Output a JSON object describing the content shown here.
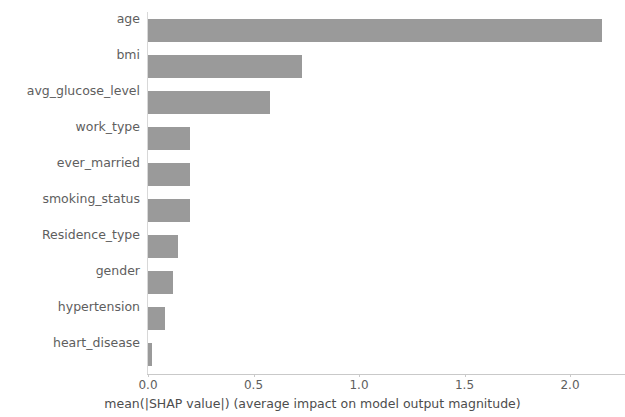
{
  "chart_data": {
    "type": "bar",
    "orientation": "horizontal",
    "title": "",
    "xlabel": "mean(|SHAP value|) (average impact on model output magnitude)",
    "ylabel": "",
    "categories": [
      "age",
      "bmi",
      "avg_glucose_level",
      "work_type",
      "ever_married",
      "smoking_status",
      "Residence_type",
      "gender",
      "hypertension",
      "heart_disease"
    ],
    "values": [
      2.15,
      0.73,
      0.58,
      0.2,
      0.2,
      0.2,
      0.14,
      0.12,
      0.08,
      0.02
    ],
    "xlim": [
      0.0,
      2.26
    ],
    "xticks": [
      0.0,
      0.5,
      1.0,
      1.5,
      2.0
    ],
    "xticklabels": [
      "0.0",
      "0.5",
      "1.0",
      "1.5",
      "2.0"
    ],
    "grid": false,
    "legend": null,
    "bar_color": "#9a9a9a",
    "axis_color": "#c9c9c9",
    "text_color": "#5e5e5e"
  }
}
